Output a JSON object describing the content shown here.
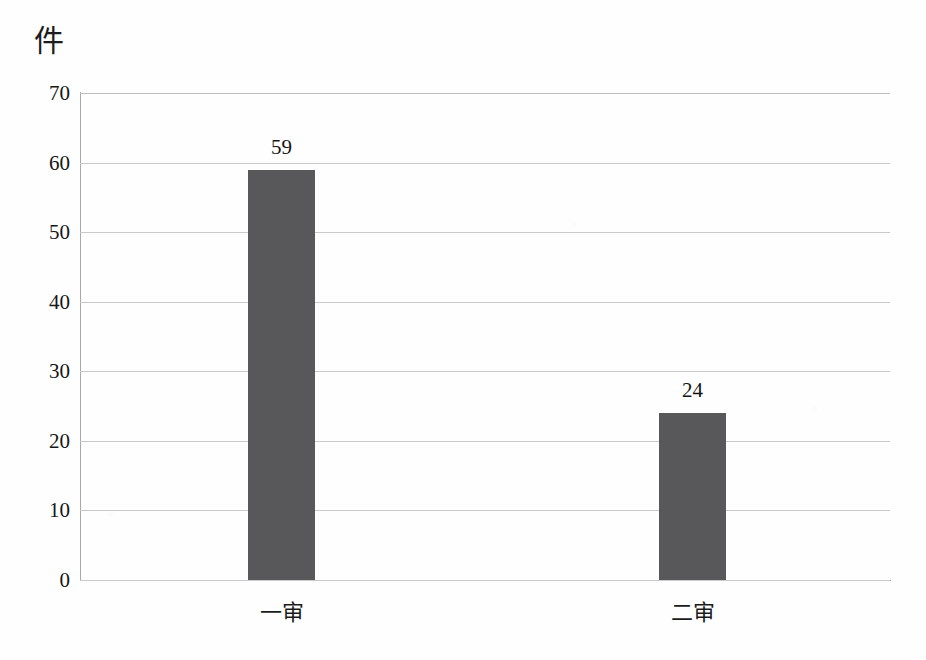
{
  "chart_data": {
    "type": "bar",
    "title": "",
    "subtitle": "",
    "xlabel": "",
    "ylabel": "件",
    "unit_label": "件",
    "categories": [
      "一审",
      "二审"
    ],
    "values": [
      59,
      24
    ],
    "data_labels": [
      "59",
      "24"
    ],
    "ylim": [
      0,
      70
    ],
    "ytick_labels": [
      "0",
      "10",
      "20",
      "30",
      "40",
      "50",
      "60",
      "70"
    ],
    "ytick_values": [
      0,
      10,
      20,
      30,
      40,
      50,
      60,
      70
    ],
    "grid": true,
    "grid_axis": "y",
    "legend": false,
    "legend_position": "none",
    "series": [
      {
        "name": "件数",
        "values": [
          59,
          24
        ],
        "color": "#58585a"
      }
    ],
    "colors": {
      "bar": "#58585a",
      "gridline": "#c9c9c9",
      "axis": "#9c9c9c",
      "text": "#161616",
      "background": "#fefefe"
    }
  }
}
